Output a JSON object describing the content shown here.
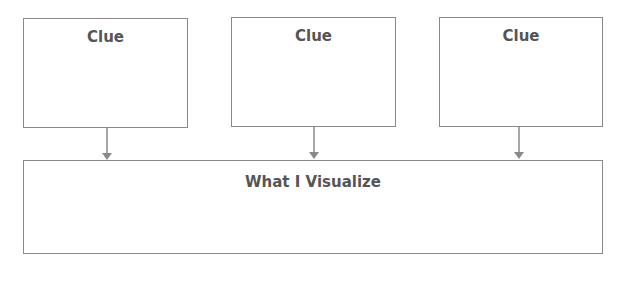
{
  "diagram": {
    "clues": [
      {
        "label": "Clue"
      },
      {
        "label": "Clue"
      },
      {
        "label": "Clue"
      }
    ],
    "result": {
      "label": "What I Visualize"
    },
    "colors": {
      "stroke": "#8a8a8a",
      "text": "#555555"
    }
  }
}
